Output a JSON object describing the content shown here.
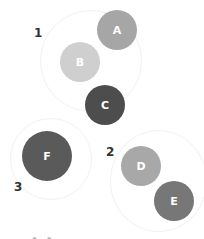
{
  "diagram": {
    "groups": [
      {
        "label": "1",
        "x": 34,
        "y": 26
      },
      {
        "label": "2",
        "x": 106,
        "y": 145
      },
      {
        "label": "3",
        "x": 14,
        "y": 180
      }
    ],
    "nodes": [
      {
        "label": "A",
        "cx": 117,
        "cy": 30,
        "r": 20,
        "color": "#a6a6a6"
      },
      {
        "label": "B",
        "cx": 80,
        "cy": 62,
        "r": 20,
        "color": "#cfcfcf"
      },
      {
        "label": "C",
        "cx": 105,
        "cy": 105,
        "r": 20,
        "color": "#4d4d4d"
      },
      {
        "label": "F",
        "cx": 47,
        "cy": 156,
        "r": 25,
        "color": "#5a5a5a"
      },
      {
        "label": "D",
        "cx": 141,
        "cy": 166,
        "r": 20,
        "color": "#a8a8a8"
      },
      {
        "label": "E",
        "cx": 174,
        "cy": 201,
        "r": 20,
        "color": "#777777"
      }
    ],
    "caption": "—  •  •"
  }
}
